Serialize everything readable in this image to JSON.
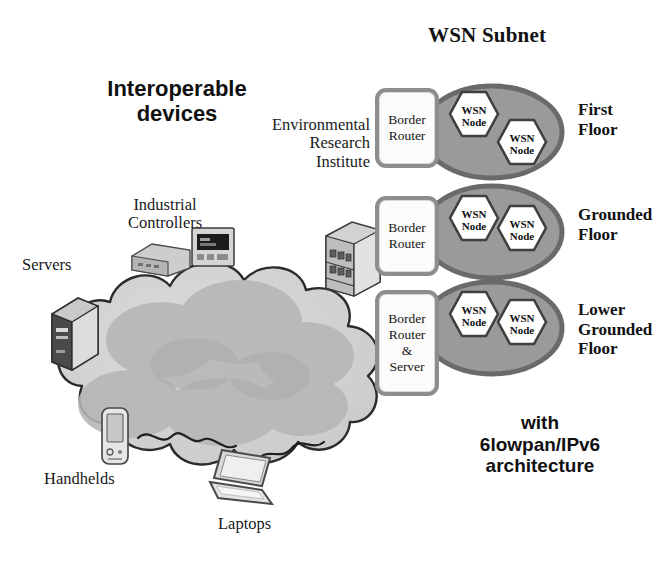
{
  "diagram": {
    "title": "WSN Subnet",
    "cloud_label": "IP network",
    "architecture_note": "with\n6lowpan/IPv6\narchitecture",
    "interoperable_label": "Interoperable\ndevices",
    "organization_label": "Environmental\nResearch\nInstitute"
  },
  "device_labels": [
    {
      "id": "industrial-controllers",
      "text": "Industrial\nControllers"
    },
    {
      "id": "servers",
      "text": "Servers"
    },
    {
      "id": "handhelds",
      "text": "Handhelds"
    },
    {
      "id": "laptops",
      "text": "Laptops"
    }
  ],
  "routers": [
    {
      "id": "router-1",
      "text": "Border\nRouter"
    },
    {
      "id": "router-2",
      "text": "Border\nRouter"
    },
    {
      "id": "router-3",
      "text": "Border\nRouter\n&\nServer"
    }
  ],
  "subnets": [
    {
      "id": "subnet-first-floor",
      "floor_label": "First\nFloor",
      "nodes": [
        {
          "text": "WSN\nNode"
        },
        {
          "text": "WSN\nNode"
        }
      ]
    },
    {
      "id": "subnet-grounded-floor",
      "floor_label": "Grounded\nFloor",
      "nodes": [
        {
          "text": "WSN\nNode"
        },
        {
          "text": "WSN\nNode"
        }
      ]
    },
    {
      "id": "subnet-lower-grounded-floor",
      "floor_label": "Lower\nGrounded\nFloor",
      "nodes": [
        {
          "text": "WSN\nNode"
        },
        {
          "text": "WSN\nNode"
        }
      ]
    }
  ],
  "icons": [
    {
      "id": "server-tower-icon"
    },
    {
      "id": "industrial-controller-icon"
    },
    {
      "id": "industrial-controller-display-icon"
    },
    {
      "id": "network-rack-icon"
    },
    {
      "id": "handheld-pda-icon"
    },
    {
      "id": "laptop-icon"
    }
  ],
  "colors": {
    "subnet_fill": "#9a9a9a",
    "subnet_stroke": "#6f6f6f",
    "node_fill": "#ffffff",
    "node_stroke": "#4a4a4a",
    "router_border": "#8d8d8d",
    "cloud_fill": "#d3d3d3",
    "cloud_inner": "#b4b4b4",
    "cloud_stroke": "#2b2b2b",
    "text": "#111111"
  }
}
